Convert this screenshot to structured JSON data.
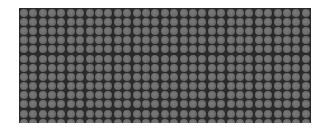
{
  "image": {
    "description": "Grid of gray circular dots on a dark background",
    "columns": 31,
    "rows": 13,
    "colors": {
      "background": "#ffffff",
      "panel": "#1c1c1c",
      "dot": "#6e6e6e"
    }
  }
}
